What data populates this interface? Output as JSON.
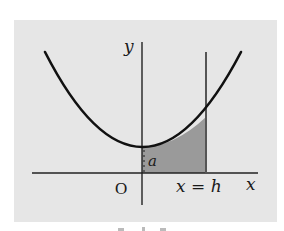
{
  "figure": {
    "labels": {
      "y_axis": "y",
      "x_axis": "x",
      "origin": "O",
      "vertex_height": "a",
      "line_label": "x = h"
    },
    "colors": {
      "background_panel": "#e6e6e6",
      "curve": "#111111",
      "axes": "#222222",
      "shaded_region": "#9a9a9a",
      "vertical_line": "#555555"
    }
  }
}
